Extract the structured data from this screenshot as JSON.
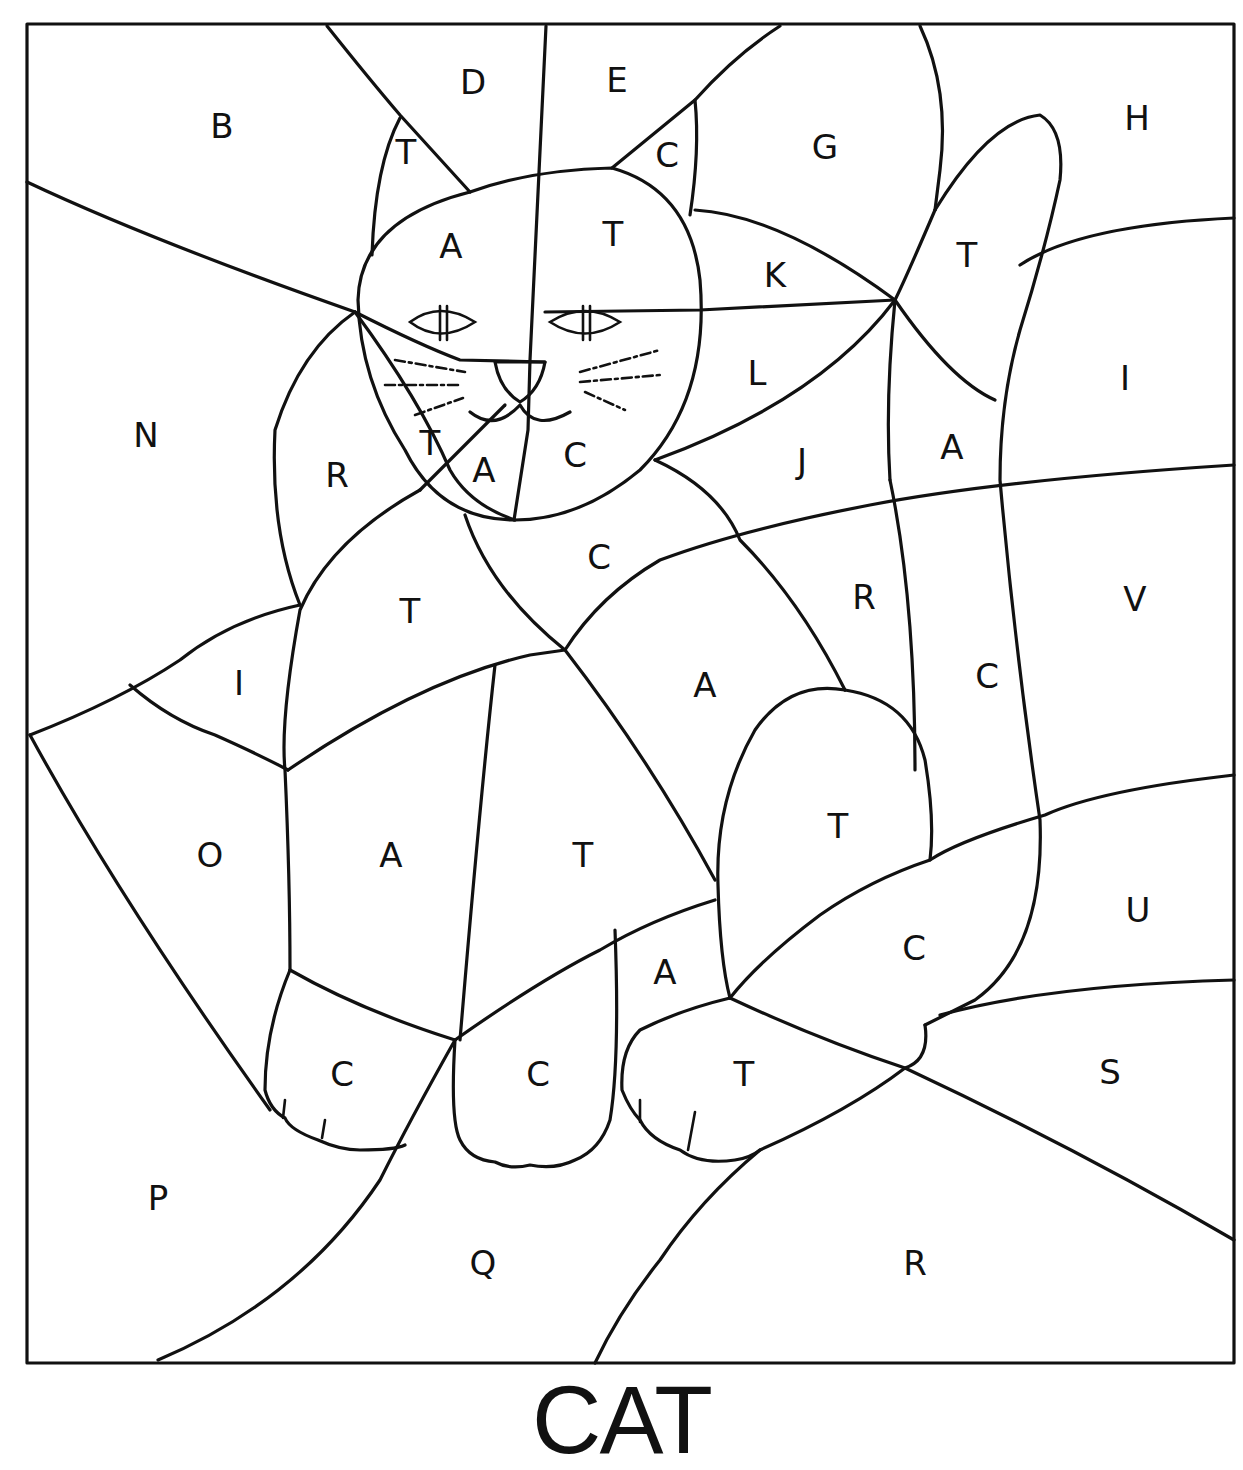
{
  "title": "CAT",
  "frame": {
    "x": 27,
    "y": 24,
    "width": 1207,
    "height": 1339,
    "stroke": "#111111",
    "background": "#ffffff"
  },
  "regions": [
    {
      "letter": "B",
      "x": 222,
      "y": 126
    },
    {
      "letter": "D",
      "x": 473,
      "y": 82
    },
    {
      "letter": "E",
      "x": 617,
      "y": 80
    },
    {
      "letter": "T",
      "x": 406,
      "y": 152
    },
    {
      "letter": "C",
      "x": 667,
      "y": 155
    },
    {
      "letter": "G",
      "x": 825,
      "y": 147
    },
    {
      "letter": "H",
      "x": 1137,
      "y": 118
    },
    {
      "letter": "A",
      "x": 451,
      "y": 246
    },
    {
      "letter": "T",
      "x": 613,
      "y": 234
    },
    {
      "letter": "K",
      "x": 775,
      "y": 275
    },
    {
      "letter": "T",
      "x": 967,
      "y": 255
    },
    {
      "letter": "N",
      "x": 146,
      "y": 435
    },
    {
      "letter": "L",
      "x": 757,
      "y": 373
    },
    {
      "letter": "I",
      "x": 1125,
      "y": 378
    },
    {
      "letter": "T",
      "x": 430,
      "y": 443
    },
    {
      "letter": "A",
      "x": 484,
      "y": 470
    },
    {
      "letter": "C",
      "x": 575,
      "y": 455
    },
    {
      "letter": "R",
      "x": 337,
      "y": 475
    },
    {
      "letter": "J",
      "x": 802,
      "y": 461
    },
    {
      "letter": "A",
      "x": 952,
      "y": 447
    },
    {
      "letter": "C",
      "x": 599,
      "y": 557
    },
    {
      "letter": "T",
      "x": 410,
      "y": 611
    },
    {
      "letter": "R",
      "x": 864,
      "y": 597
    },
    {
      "letter": "V",
      "x": 1135,
      "y": 599
    },
    {
      "letter": "I",
      "x": 239,
      "y": 683
    },
    {
      "letter": "A",
      "x": 705,
      "y": 685
    },
    {
      "letter": "C",
      "x": 987,
      "y": 676
    },
    {
      "letter": "O",
      "x": 210,
      "y": 855
    },
    {
      "letter": "A",
      "x": 391,
      "y": 855
    },
    {
      "letter": "T",
      "x": 583,
      "y": 855
    },
    {
      "letter": "T",
      "x": 838,
      "y": 826
    },
    {
      "letter": "U",
      "x": 1138,
      "y": 910
    },
    {
      "letter": "A",
      "x": 665,
      "y": 972
    },
    {
      "letter": "C",
      "x": 914,
      "y": 948
    },
    {
      "letter": "C",
      "x": 342,
      "y": 1074
    },
    {
      "letter": "C",
      "x": 538,
      "y": 1074
    },
    {
      "letter": "T",
      "x": 744,
      "y": 1074
    },
    {
      "letter": "S",
      "x": 1110,
      "y": 1072
    },
    {
      "letter": "P",
      "x": 158,
      "y": 1198
    },
    {
      "letter": "Q",
      "x": 483,
      "y": 1263
    },
    {
      "letter": "R",
      "x": 915,
      "y": 1263
    }
  ]
}
